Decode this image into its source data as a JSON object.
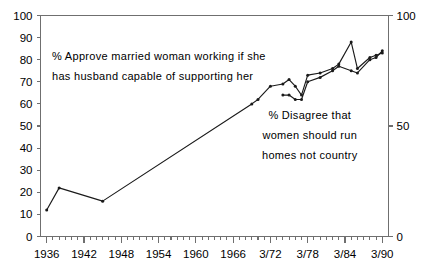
{
  "chart_data": {
    "type": "line",
    "title": "",
    "xlabel": "",
    "ylabel": "",
    "ylim": [
      0,
      100
    ],
    "y_right_lim": [
      0,
      100
    ],
    "grid": false,
    "legend_position": "inline-annotations",
    "y_ticks_left": [
      "0",
      "10",
      "20",
      "30",
      "40",
      "50",
      "60",
      "70",
      "80",
      "90",
      "100"
    ],
    "y_ticks_right": [
      "0",
      "50",
      "100"
    ],
    "x_tick_labels": [
      "1936",
      "1942",
      "1948",
      "1954",
      "1960",
      "1966",
      "3/72",
      "3/78",
      "3/84",
      "3/90"
    ],
    "x_axis_note": "annual minor ticks; major labelled ticks every 6 years",
    "series": [
      {
        "name": "% Approve married woman working if she has husband capable of supporting her",
        "annotation": "approve-married-woman-working",
        "points": [
          {
            "x": "1936",
            "y": 12
          },
          {
            "x": "1938",
            "y": 22
          },
          {
            "x": "1945",
            "y": 16
          },
          {
            "x": "1969",
            "y": 60
          },
          {
            "x": "1970",
            "y": 62
          },
          {
            "x": "3/72",
            "y": 68
          },
          {
            "x": "3/74",
            "y": 69
          },
          {
            "x": "3/75",
            "y": 71
          },
          {
            "x": "3/76",
            "y": 68
          },
          {
            "x": "3/77",
            "y": 64
          },
          {
            "x": "3/78",
            "y": 73
          },
          {
            "x": "3/80",
            "y": 74
          },
          {
            "x": "3/82",
            "y": 76
          },
          {
            "x": "3/83",
            "y": 78
          },
          {
            "x": "3/85",
            "y": 88
          },
          {
            "x": "3/86",
            "y": 76
          },
          {
            "x": "3/88",
            "y": 81
          },
          {
            "x": "3/89",
            "y": 82
          },
          {
            "x": "3/90",
            "y": 83
          }
        ]
      },
      {
        "name": "% Disagree that women should run homes not country",
        "annotation": "disagree-women-run-homes",
        "points": [
          {
            "x": "3/74",
            "y": 64
          },
          {
            "x": "3/75",
            "y": 64
          },
          {
            "x": "3/76",
            "y": 62
          },
          {
            "x": "3/77",
            "y": 62
          },
          {
            "x": "3/78",
            "y": 70
          },
          {
            "x": "3/80",
            "y": 72
          },
          {
            "x": "3/82",
            "y": 75
          },
          {
            "x": "3/83",
            "y": 77
          },
          {
            "x": "3/85",
            "y": 75
          },
          {
            "x": "3/86",
            "y": 74
          },
          {
            "x": "3/88",
            "y": 80
          },
          {
            "x": "3/89",
            "y": 81
          },
          {
            "x": "3/90",
            "y": 84
          }
        ]
      }
    ]
  },
  "annotations": {
    "approve": {
      "line1": "% Approve married woman working if she",
      "line2": "has husband capable of supporting her"
    },
    "disagree": {
      "line1": "% Disagree that",
      "line2": "women should run",
      "line3": "homes not country"
    }
  },
  "colors": {
    "series_stroke": "#1a1a1a",
    "axis": "#6f6f6f",
    "background": "#ffffff",
    "text": "#000000"
  }
}
